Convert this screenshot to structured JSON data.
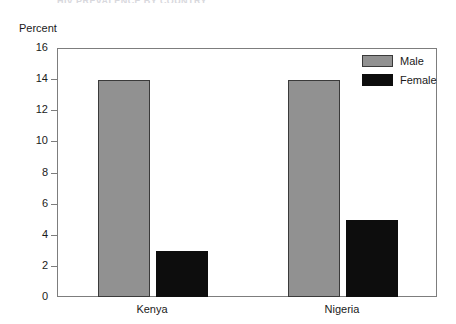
{
  "chart_data": {
    "type": "bar",
    "title": "HIV PREVALENCE BY COUNTRY",
    "ylabel": "Percent",
    "xlabel": "",
    "categories": [
      "Kenya",
      "Nigeria"
    ],
    "series": [
      {
        "name": "Male",
        "values": [
          14,
          14
        ],
        "color": "#919191"
      },
      {
        "name": "Female",
        "values": [
          3,
          5
        ],
        "color": "#0d0d0d"
      }
    ],
    "ylim": [
      0,
      16
    ],
    "yticks": [
      0,
      2,
      4,
      6,
      8,
      10,
      12,
      14,
      16
    ],
    "ytick_labels": [
      "0",
      "2",
      "4",
      "6",
      "8",
      "10",
      "12",
      "14",
      "16"
    ],
    "grid": false,
    "legend_position": "top-right"
  },
  "legend": {
    "entries": [
      {
        "label": "Male"
      },
      {
        "label": "Female"
      }
    ]
  }
}
